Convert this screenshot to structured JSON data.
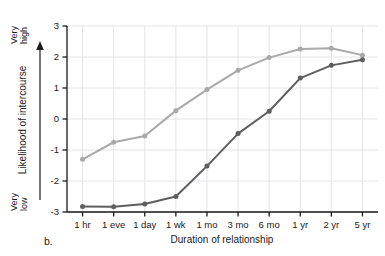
{
  "panel": {
    "label": "b."
  },
  "axis": {
    "y_title": "Likelihood of intercourse",
    "y_high_line1": "Very",
    "y_high_line2": "high",
    "y_low_line1": "Very",
    "y_low_line2": "low",
    "x_title": "Duration of relationship",
    "y_ticks": [
      "3",
      "2",
      "1",
      "0",
      "-1",
      "-2",
      "-3"
    ]
  },
  "colors": {
    "light_series": "#a9a9a9",
    "dark_series": "#5e5e5e",
    "axis": "#1a1a1a",
    "grid": "#e4e4e8",
    "background": "#ffffff"
  },
  "chart_data": {
    "type": "line",
    "title": "",
    "xlabel": "Duration of relationship",
    "ylabel": "Likelihood of intercourse",
    "ylim": [
      -3,
      3
    ],
    "yticks": [
      3,
      2,
      1,
      0,
      -1,
      -2,
      -3
    ],
    "y_axis_anchors": {
      "high": "Very high",
      "low": "Very low"
    },
    "grid": true,
    "legend": "none",
    "categories": [
      "1 hr",
      "1 eve",
      "1 day",
      "1 wk",
      "1 mo",
      "3 mo",
      "6 mo",
      "1 yr",
      "2 yr",
      "5 yr"
    ],
    "series": [
      {
        "name": "light-series",
        "color": "#a9a9a9",
        "values": [
          -1.3,
          -0.75,
          -0.55,
          0.27,
          0.95,
          1.57,
          1.98,
          2.26,
          2.28,
          2.06
        ]
      },
      {
        "name": "dark-series",
        "color": "#5e5e5e",
        "values": [
          -2.82,
          -2.83,
          -2.74,
          -2.5,
          -1.52,
          -0.47,
          0.25,
          1.32,
          1.73,
          1.91
        ]
      }
    ]
  }
}
